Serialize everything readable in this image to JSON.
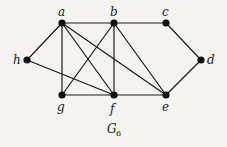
{
  "graph": {
    "caption": "G",
    "caption_subscript": "6",
    "nodes": [
      {
        "id": "a",
        "label": "a",
        "x": 62,
        "y": 23
      },
      {
        "id": "b",
        "label": "b",
        "x": 114,
        "y": 23
      },
      {
        "id": "c",
        "label": "c",
        "x": 166,
        "y": 23
      },
      {
        "id": "h",
        "label": "h",
        "x": 27,
        "y": 60
      },
      {
        "id": "d",
        "label": "d",
        "x": 201,
        "y": 60
      },
      {
        "id": "g",
        "label": "g",
        "x": 62,
        "y": 95
      },
      {
        "id": "f",
        "label": "f",
        "x": 114,
        "y": 95
      },
      {
        "id": "e",
        "label": "e",
        "x": 166,
        "y": 95
      }
    ],
    "edges": [
      [
        "a",
        "b"
      ],
      [
        "b",
        "c"
      ],
      [
        "c",
        "d"
      ],
      [
        "d",
        "e"
      ],
      [
        "a",
        "h"
      ],
      [
        "a",
        "g"
      ],
      [
        "a",
        "f"
      ],
      [
        "a",
        "e"
      ],
      [
        "b",
        "g"
      ],
      [
        "b",
        "f"
      ],
      [
        "b",
        "e"
      ],
      [
        "h",
        "f"
      ],
      [
        "g",
        "f"
      ],
      [
        "f",
        "e"
      ]
    ]
  }
}
